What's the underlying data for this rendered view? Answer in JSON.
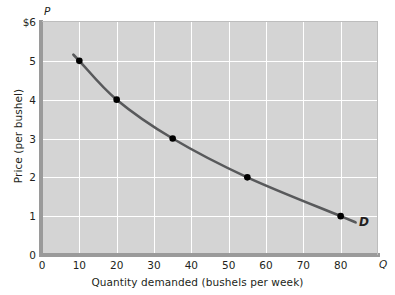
{
  "chart_data": {
    "type": "line",
    "title": "",
    "xlabel": "Quantity demanded (bushels per week)",
    "ylabel": "Price (per bushel)",
    "x_axis_marker": "Q",
    "y_axis_marker": "P",
    "xlim": [
      0,
      90
    ],
    "ylim": [
      0,
      6
    ],
    "grid": true,
    "legend": "none",
    "x_ticks": [
      "0",
      "10",
      "20",
      "30",
      "40",
      "50",
      "60",
      "70",
      "80"
    ],
    "x_tick_values": [
      0,
      10,
      20,
      30,
      40,
      50,
      60,
      70,
      80
    ],
    "y_ticks": [
      "0",
      "1",
      "2",
      "3",
      "4",
      "5",
      "$6"
    ],
    "y_tick_values": [
      0,
      1,
      2,
      3,
      4,
      5,
      6
    ],
    "series": [
      {
        "name": "D",
        "label": "D",
        "color": "#58595b",
        "marker_color": "#000000",
        "x": [
          10,
          20,
          35,
          55,
          80
        ],
        "y": [
          5,
          4,
          3,
          2,
          1
        ],
        "points": [
          {
            "quantity": 10,
            "price": 5
          },
          {
            "quantity": 20,
            "price": 4
          },
          {
            "quantity": 35,
            "price": 3
          },
          {
            "quantity": 55,
            "price": 2
          },
          {
            "quantity": 80,
            "price": 1
          }
        ]
      }
    ],
    "annotations": [
      {
        "text": "D",
        "quantity": 86,
        "price": 0.95
      }
    ],
    "colors": {
      "plot_background": "#d4d4d4",
      "gridline": "#ffffff",
      "axis": "#9a9a9a",
      "curve": "#58595b",
      "text": "#231f20"
    }
  }
}
